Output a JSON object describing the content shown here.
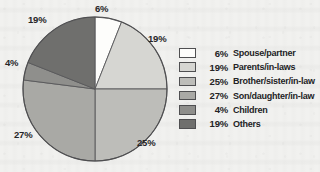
{
  "chart_data": {
    "type": "pie",
    "title": "",
    "categories": [
      "Spouse/partner",
      "Parents/in-laws",
      "Brother/sister/in-law",
      "Son/daughter/in-law",
      "Children",
      "Others"
    ],
    "values": [
      6,
      19,
      25,
      27,
      4,
      19
    ],
    "value_labels": [
      "6%",
      "19%",
      "25%",
      "27%",
      "4%",
      "19%"
    ],
    "colors": [
      "#fdfdfb",
      "#d6d6d2",
      "#bdbdb9",
      "#a9a9a5",
      "#8f8f8c",
      "#6f6f6d"
    ],
    "legend_position": "right",
    "grid": false,
    "start_angle_deg": 0,
    "direction": "clockwise",
    "units": "percent"
  },
  "pie": {
    "callouts": [
      {
        "text": "6%",
        "slice": "Spouse/partner",
        "x": 95,
        "y": 4
      },
      {
        "text": "19%",
        "slice": "Parents/in-laws",
        "x": 148,
        "y": 34
      },
      {
        "text": "25%",
        "slice": "Brother/sister/in-law",
        "x": 137,
        "y": 138
      },
      {
        "text": "27%",
        "slice": "Son/daughter/in-law",
        "x": 14,
        "y": 130
      },
      {
        "text": "4%",
        "slice": "Children",
        "x": 5,
        "y": 58
      },
      {
        "text": "19%",
        "slice": "Others",
        "x": 28,
        "y": 15
      }
    ],
    "center_x": 95,
    "center_y": 89,
    "radius": 72
  },
  "legend": {
    "rows": [
      {
        "percent": "6%",
        "label": "Spouse/partner",
        "color": "#fdfdfb"
      },
      {
        "percent": "19%",
        "label": "Parents/in-laws",
        "color": "#d6d6d2"
      },
      {
        "percent": "25%",
        "label": "Brother/sister/in-law",
        "color": "#bdbdb9"
      },
      {
        "percent": "27%",
        "label": "Son/daughter/in-law",
        "color": "#a9a9a5"
      },
      {
        "percent": "4%",
        "label": "Children",
        "color": "#8f8f8c"
      },
      {
        "percent": "19%",
        "label": "Others",
        "color": "#6f6f6d"
      }
    ]
  }
}
